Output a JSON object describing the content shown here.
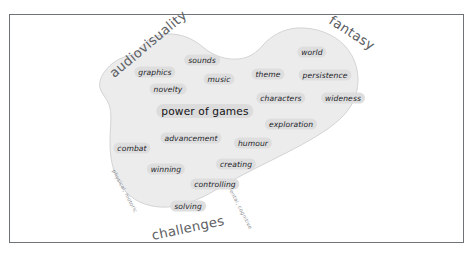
{
  "figure": {
    "frame_color": "#6f7276",
    "background_color": "#ffffff",
    "cloud_fill": "#ececed",
    "cloud_stroke": "#d4d4d6",
    "pill_fill": "#dededf",
    "label_color": "#5d6064",
    "sub_label_color": "#8b8e92"
  },
  "center": {
    "label": "power of games"
  },
  "categories": [
    {
      "name": "audiovisuality",
      "label": "audiovisuality",
      "x": 148,
      "y": 44,
      "rotate": -40
    },
    {
      "name": "fantasy",
      "label": "fantasy",
      "x": 352,
      "y": 33,
      "rotate": 33
    },
    {
      "name": "challenges",
      "label": "challenges",
      "x": 188,
      "y": 228,
      "rotate": -12
    }
  ],
  "sub_labels": [
    {
      "name": "physical-motoric",
      "label": "physical, motoric",
      "x": 125,
      "y": 191,
      "rotate": 62
    },
    {
      "name": "mental-cognitive",
      "label": "mental, cognitive",
      "x": 240,
      "y": 207,
      "rotate": 63
    }
  ],
  "terms": [
    {
      "name": "graphics",
      "label": "graphics",
      "x": 155,
      "y": 72
    },
    {
      "name": "sounds",
      "label": "sounds",
      "x": 202,
      "y": 60
    },
    {
      "name": "music",
      "label": "music",
      "x": 219,
      "y": 79
    },
    {
      "name": "novelty",
      "label": "novelty",
      "x": 168,
      "y": 89
    },
    {
      "name": "theme",
      "label": "theme",
      "x": 268,
      "y": 74
    },
    {
      "name": "world",
      "label": "world",
      "x": 312,
      "y": 52
    },
    {
      "name": "persistence",
      "label": "persistence",
      "x": 325,
      "y": 75
    },
    {
      "name": "characters",
      "label": "characters",
      "x": 281,
      "y": 98
    },
    {
      "name": "wideness",
      "label": "wideness",
      "x": 343,
      "y": 98
    },
    {
      "name": "exploration",
      "label": "exploration",
      "x": 291,
      "y": 124
    },
    {
      "name": "advancement",
      "label": "advancement",
      "x": 191,
      "y": 138
    },
    {
      "name": "humour",
      "label": "humour",
      "x": 253,
      "y": 143
    },
    {
      "name": "combat",
      "label": "combat",
      "x": 132,
      "y": 148
    },
    {
      "name": "winning",
      "label": "winning",
      "x": 166,
      "y": 169
    },
    {
      "name": "creating",
      "label": "creating",
      "x": 236,
      "y": 164
    },
    {
      "name": "controlling",
      "label": "controlling",
      "x": 215,
      "y": 184
    },
    {
      "name": "solving",
      "label": "solving",
      "x": 188,
      "y": 206
    }
  ],
  "cloud_path": "M 137,53 C 143,40 158,33 172,34 C 186,35 196,41 204,48 C 214,56 226,60 238,59 C 250,58 257,52 263,45 C 271,36 283,29 297,28 C 316,27 334,34 345,46 C 356,58 360,74 357,90 C 354,106 343,118 329,128 C 312,140 292,150 272,160 C 252,170 232,180 214,191 C 200,199 184,206 168,207 C 152,208 136,203 126,192 C 114,179 110,160 110,143 C 110,128 112,117 110,108 C 108,99 102,95 100,88 C 98,80 104,70 113,63 C 122,56 130,56 137,53 Z"
}
